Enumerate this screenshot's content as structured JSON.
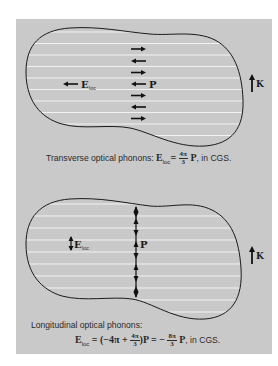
{
  "colors": {
    "page_background": "#ffffff",
    "panel_background": "#c9c9c9",
    "outline": "#1a1a1a",
    "stripes": "#f2f2f2"
  },
  "transverse": {
    "labels": {
      "field": "E",
      "field_sub": "loc",
      "polarization": "P",
      "wavevector": "K"
    },
    "arrow_directions": [
      "right",
      "left",
      "right",
      "left",
      "right",
      "left",
      "right"
    ],
    "field_arrow_direction": "left",
    "caption": {
      "text": "Transverse optical phonons:",
      "eq_lhs": "E",
      "eq_lhs_sub": "loc",
      "eq_equals": "=",
      "frac_num": "4π",
      "frac_den": "3",
      "eq_rhs": "P",
      "suffix": ", in CGS."
    }
  },
  "longitudinal": {
    "labels": {
      "field": "E",
      "field_sub": "loc",
      "polarization": "P",
      "wavevector": "K"
    },
    "arrow_directions": [
      "up",
      "down",
      "up",
      "down",
      "up",
      "down",
      "up"
    ],
    "field_arrow_direction": "down",
    "caption": {
      "text": "Longitudinal optical phonons:",
      "eq_lhs": "E",
      "eq_lhs_sub": "loc",
      "eq_part1": "= (−4π +",
      "frac1_num": "4π",
      "frac1_den": "3",
      "eq_part2": ")P = −",
      "frac2_num": "8π",
      "frac2_den": "3",
      "eq_rhs": "P",
      "suffix": ", in CGS."
    }
  }
}
